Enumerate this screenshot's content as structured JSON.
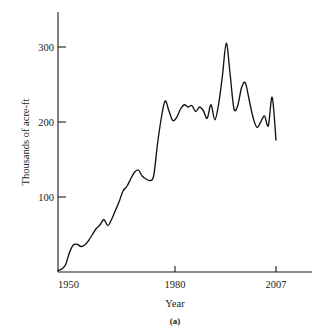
{
  "figure": {
    "caption": "(a)"
  },
  "chart_data": {
    "type": "line",
    "title": "",
    "subtitle": "",
    "xlabel": "Year",
    "ylabel": "Thousands of acre-ft",
    "xlim": [
      1950,
      2007
    ],
    "ylim": [
      0,
      330
    ],
    "xticks": [
      1950,
      1980,
      2007
    ],
    "xtick_labels": [
      "1950",
      "1980",
      "2007"
    ],
    "yticks": [
      100,
      200,
      300
    ],
    "ytick_labels": [
      "100",
      "200",
      "300"
    ],
    "grid": false,
    "legend": null,
    "legend_position": "none",
    "annotations": [],
    "series": [
      {
        "name": "Annual water use",
        "color": "#111111",
        "x": [
          1950,
          1951,
          1952,
          1953,
          1954,
          1955,
          1956,
          1957,
          1958,
          1959,
          1960,
          1961,
          1962,
          1963,
          1964,
          1965,
          1966,
          1967,
          1968,
          1969,
          1970,
          1971,
          1972,
          1973,
          1974,
          1975,
          1976,
          1977,
          1978,
          1979,
          1980,
          1981,
          1982,
          1983,
          1984,
          1985,
          1986,
          1987,
          1988,
          1989,
          1990,
          1991,
          1992,
          1993,
          1994,
          1995,
          1996,
          1997,
          1998,
          1999,
          2000,
          2001,
          2002,
          2003,
          2004,
          2005,
          2006,
          2007
        ],
        "values": [
          2,
          4,
          10,
          26,
          36,
          37,
          34,
          36,
          42,
          50,
          58,
          63,
          70,
          62,
          70,
          82,
          94,
          108,
          114,
          124,
          133,
          136,
          128,
          124,
          122,
          128,
          170,
          205,
          228,
          215,
          202,
          206,
          217,
          223,
          220,
          222,
          214,
          220,
          215,
          205,
          223,
          203,
          224,
          262,
          305,
          264,
          218,
          222,
          246,
          252,
          229,
          206,
          193,
          200,
          208,
          195,
          233,
          176
        ]
      }
    ]
  },
  "axis_pixels": {
    "x_1950": 58,
    "x_1980": 175,
    "x_2007": 276,
    "y_0": 272,
    "y_100": 197,
    "y_200": 122,
    "y_300": 47
  }
}
